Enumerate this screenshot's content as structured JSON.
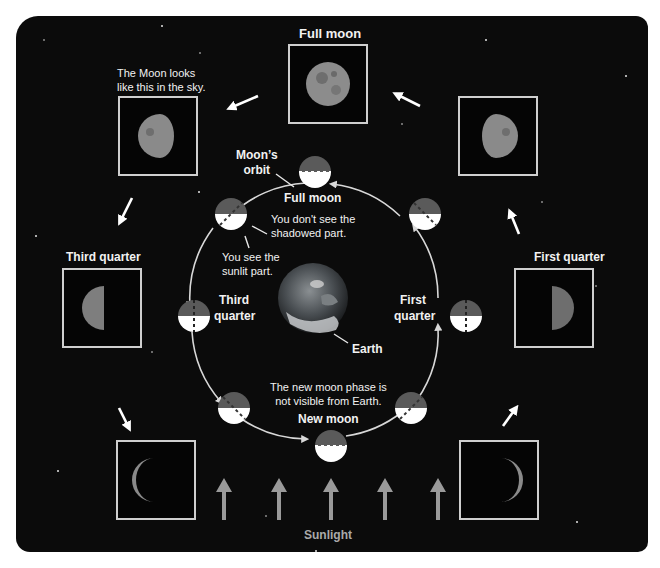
{
  "photo_labels": {
    "top": "Full moon",
    "left": "Third quarter",
    "right": "First quarter"
  },
  "annotations": {
    "sky_note_line1": "The Moon looks",
    "sky_note_line2": "like this in the sky.",
    "orbit_line1": "Moon’s",
    "orbit_line2": "orbit",
    "shadowed_line1": "You don't see the",
    "shadowed_line2": "shadowed part.",
    "sunlit_line1": "You see the",
    "sunlit_line2": "sunlit part.",
    "new_moon_note_line1": "The new moon phase is",
    "new_moon_note_line2": "not visible from Earth."
  },
  "orbit_labels": {
    "full": "Full moon",
    "third_line1": "Third",
    "third_line2": "quarter",
    "first_line1": "First",
    "first_line2": "quarter",
    "new": "New moon",
    "earth": "Earth"
  },
  "sunlight_label": "Sunlight",
  "icons": {
    "moon_photo": "moon-photo-icon",
    "orbit_moon": "half-lit-moon-icon",
    "earth": "earth-globe-icon",
    "arrow": "arrow-icon"
  },
  "colors": {
    "background": "#0b0b0b",
    "text": "#f2f2f2",
    "moon_shadow": "#5a5a5a",
    "moon_lit": "#ffffff",
    "frame": "#cfcfcf",
    "sun_arrow": "#9a9a9a"
  },
  "sunlight_arrow_count": 5
}
